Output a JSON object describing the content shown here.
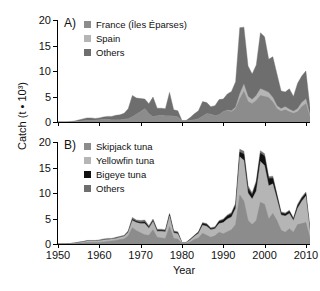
{
  "figure": {
    "axis_title_y": "Catch (t • 10³)",
    "axis_title_x": "Year"
  },
  "chart_data": {
    "type": "area",
    "title": "",
    "xlabel": "Year",
    "ylabel": "Catch (t • 10³)",
    "xlim": [
      1950,
      2011
    ],
    "ylim": [
      0,
      20
    ],
    "yticks": [
      0,
      5,
      10,
      15,
      20
    ],
    "xticks": [
      1950,
      1960,
      1970,
      1980,
      1990,
      2000,
      2010
    ],
    "grid": false,
    "stacked": true,
    "legend_position": "top-left",
    "panels": [
      {
        "tag": "A)",
        "legend": [
          {
            "label": "France (Îles Éparses)",
            "color": "#8c8c8c"
          },
          {
            "label": "Spain",
            "color": "#b5b5b5"
          },
          {
            "label": "Others",
            "color": "#6e6e6e"
          }
        ],
        "x": [
          1950,
          1951,
          1952,
          1953,
          1954,
          1955,
          1956,
          1957,
          1958,
          1959,
          1960,
          1961,
          1962,
          1963,
          1964,
          1965,
          1966,
          1967,
          1968,
          1969,
          1970,
          1971,
          1972,
          1973,
          1974,
          1975,
          1976,
          1977,
          1978,
          1979,
          1980,
          1981,
          1982,
          1983,
          1984,
          1985,
          1986,
          1987,
          1988,
          1989,
          1990,
          1991,
          1992,
          1993,
          1994,
          1995,
          1996,
          1997,
          1998,
          1999,
          2000,
          2001,
          2002,
          2003,
          2004,
          2005,
          2006,
          2007,
          2008,
          2009,
          2010,
          2011
        ],
        "series": [
          {
            "name": "France (Îles Éparses)",
            "color": "#8c8c8c",
            "values": [
              0,
              0,
              0,
              0,
              0,
              0.1,
              0.2,
              0.3,
              0.3,
              0.3,
              0.4,
              0.5,
              0.5,
              0.4,
              0.4,
              0.4,
              0.5,
              0.6,
              1.0,
              1.5,
              2.0,
              2.6,
              1.6,
              1.0,
              1.2,
              1.3,
              1.2,
              1.2,
              1.1,
              1.0,
              0.2,
              0.2,
              0.3,
              0.4,
              0.6,
              1.1,
              1.6,
              1.5,
              1.2,
              1.4,
              2.0,
              2.2,
              2.0,
              2.6,
              4.5,
              6.0,
              4.0,
              3.6,
              4.2,
              5.2,
              5.0,
              4.8,
              3.9,
              2.6,
              2.1,
              2.4,
              2.0,
              1.7,
              2.0,
              3.0,
              3.6,
              1.0
            ]
          },
          {
            "name": "Spain",
            "color": "#b5b5b5",
            "values": [
              0,
              0,
              0,
              0,
              0,
              0,
              0,
              0,
              0,
              0,
              0,
              0,
              0,
              0,
              0,
              0,
              0,
              0,
              0,
              0,
              0,
              0,
              0,
              0,
              0,
              0,
              0,
              0,
              0,
              0,
              0,
              0,
              0,
              0,
              0,
              0,
              0,
              0,
              0,
              0,
              0,
              0.1,
              0.2,
              0.3,
              1.0,
              1.4,
              1.0,
              0.8,
              1.0,
              1.3,
              1.2,
              1.0,
              0.9,
              0.6,
              0.5,
              0.6,
              0.5,
              0.4,
              0.6,
              0.8,
              0.9,
              0.3
            ]
          },
          {
            "name": "Others",
            "color": "#6e6e6e",
            "values": [
              0,
              0,
              0,
              0.1,
              0.2,
              0.3,
              0.4,
              0.5,
              0.5,
              0.4,
              0.4,
              0.5,
              0.6,
              0.7,
              0.9,
              1.0,
              1.2,
              2.0,
              4.2,
              3.2,
              2.6,
              1.9,
              2.0,
              3.9,
              1.5,
              1.4,
              1.4,
              4.6,
              1.3,
              1.2,
              0.1,
              0.1,
              0.6,
              1.2,
              1.6,
              2.9,
              2.2,
              1.5,
              2.0,
              3.0,
              2.5,
              3.2,
              3.8,
              5.0,
              13.0,
              11.2,
              6.0,
              5.0,
              6.0,
              11.0,
              10.5,
              6.5,
              8.0,
              6.2,
              3.5,
              2.9,
              4.0,
              2.9,
              5.0,
              5.2,
              5.5,
              1.5
            ]
          }
        ]
      },
      {
        "tag": "B)",
        "legend": [
          {
            "label": "Skipjack tuna",
            "color": "#8c8c8c"
          },
          {
            "label": "Yellowfin tuna",
            "color": "#b5b5b5"
          },
          {
            "label": "Bigeye tuna",
            "color": "#111111"
          },
          {
            "label": "Others",
            "color": "#6e6e6e"
          }
        ],
        "x": [
          1950,
          1951,
          1952,
          1953,
          1954,
          1955,
          1956,
          1957,
          1958,
          1959,
          1960,
          1961,
          1962,
          1963,
          1964,
          1965,
          1966,
          1967,
          1968,
          1969,
          1970,
          1971,
          1972,
          1973,
          1974,
          1975,
          1976,
          1977,
          1978,
          1979,
          1980,
          1981,
          1982,
          1983,
          1984,
          1985,
          1986,
          1987,
          1988,
          1989,
          1990,
          1991,
          1992,
          1993,
          1994,
          1995,
          1996,
          1997,
          1998,
          1999,
          2000,
          2001,
          2002,
          2003,
          2004,
          2005,
          2006,
          2007,
          2008,
          2009,
          2010,
          2011
        ],
        "series": [
          {
            "name": "Skipjack tuna",
            "color": "#8c8c8c",
            "values": [
              0,
              0,
              0,
              0.1,
              0.1,
              0.2,
              0.2,
              0.3,
              0.3,
              0.3,
              0.3,
              0.4,
              0.5,
              0.6,
              0.7,
              0.9,
              1.0,
              1.6,
              3.2,
              2.6,
              2.2,
              1.8,
              1.7,
              2.8,
              1.3,
              1.2,
              1.1,
              3.4,
              1.1,
              1.0,
              0.1,
              0.1,
              0.4,
              0.9,
              1.2,
              2.1,
              1.7,
              1.3,
              1.6,
              2.3,
              2.0,
              2.4,
              2.8,
              3.8,
              9.6,
              8.4,
              4.6,
              3.8,
              4.6,
              8.2,
              7.8,
              4.9,
              6.0,
              4.6,
              2.7,
              2.3,
              3.0,
              2.3,
              3.8,
              4.0,
              4.2,
              1.2
            ]
          },
          {
            "name": "Yellowfin tuna",
            "color": "#b5b5b5",
            "values": [
              0,
              0,
              0,
              0,
              0.1,
              0.1,
              0.2,
              0.3,
              0.3,
              0.3,
              0.4,
              0.4,
              0.4,
              0.4,
              0.4,
              0.4,
              0.5,
              0.7,
              1.4,
              1.6,
              1.8,
              2.2,
              1.4,
              1.6,
              1.2,
              1.3,
              1.3,
              2.1,
              1.1,
              1.0,
              0.2,
              0.2,
              0.4,
              0.6,
              0.9,
              1.6,
              1.8,
              1.5,
              1.4,
              1.7,
              2.2,
              2.5,
              2.5,
              3.2,
              7.5,
              8.0,
              5.4,
              5.0,
              5.8,
              8.0,
              7.6,
              6.5,
              5.8,
              4.2,
              3.0,
              3.2,
              3.0,
              2.3,
              3.2,
              4.4,
              5.2,
              1.5
            ]
          },
          {
            "name": "Bigeye tuna",
            "color": "#111111",
            "values": [
              0,
              0,
              0,
              0,
              0,
              0,
              0,
              0,
              0,
              0,
              0,
              0,
              0,
              0,
              0,
              0,
              0,
              0.1,
              0.2,
              0.2,
              0.2,
              0.3,
              0.2,
              0.2,
              0.2,
              0.2,
              0.2,
              0.3,
              0.2,
              0.2,
              0,
              0,
              0.1,
              0.1,
              0.2,
              0.3,
              0.3,
              0.2,
              0.2,
              0.4,
              0.5,
              0.6,
              0.6,
              0.7,
              0.9,
              1.2,
              0.9,
              0.8,
              1.6,
              1.6,
              1.8,
              1.4,
              1.1,
              0.7,
              0.4,
              0.4,
              0.4,
              0.3,
              0.5,
              0.5,
              0.5,
              0.1
            ]
          },
          {
            "name": "Others",
            "color": "#6e6e6e",
            "values": [
              0,
              0,
              0,
              0,
              0,
              0.1,
              0.1,
              0.1,
              0.1,
              0.1,
              0.1,
              0.2,
              0.2,
              0.1,
              0.2,
              0.2,
              0.2,
              0.2,
              0.4,
              0.3,
              0.4,
              0.4,
              0.3,
              0.3,
              0.2,
              0.2,
              0.2,
              0.2,
              0.2,
              0.2,
              0,
              0,
              0.1,
              0.1,
              0.1,
              0.2,
              0.2,
              0.2,
              0.2,
              0.2,
              0.2,
              0.2,
              0.3,
              0.3,
              0.6,
              0.6,
              0.5,
              0.4,
              0.4,
              0.5,
              0.5,
              0.4,
              0.4,
              0.3,
              0.2,
              0.2,
              0.2,
              0.2,
              0.3,
              0.3,
              0.3,
              0.1
            ]
          }
        ]
      }
    ]
  }
}
